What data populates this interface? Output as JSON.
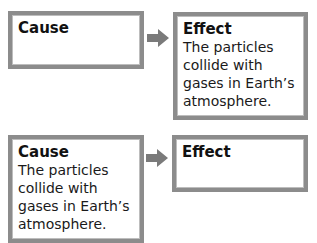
{
  "rows": [
    {
      "cause": {
        "title": "Cause",
        "text": ""
      },
      "effect": {
        "title": "Effect",
        "text_lines": [
          "The particles",
          "collide with",
          "gases in Earth’s",
          "atmosphere."
        ]
      }
    },
    {
      "cause": {
        "title": "Cause",
        "text_lines": [
          "The particles",
          "collide with",
          "gases in Earth’s",
          "atmosphere."
        ]
      },
      "effect": {
        "title": "Effect",
        "text": ""
      }
    }
  ],
  "colors": {
    "border": "#8c8c8c",
    "arrow": "#7a7a7a"
  }
}
